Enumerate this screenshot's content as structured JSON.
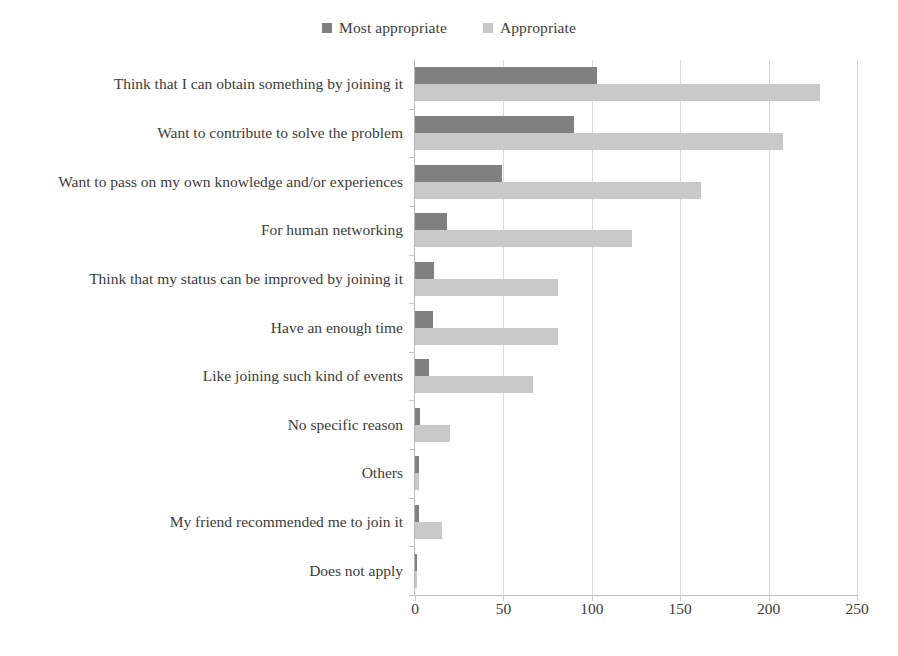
{
  "chart_data": {
    "type": "bar",
    "orientation": "horizontal",
    "title": "",
    "xlabel": "",
    "ylabel": "",
    "xlim": [
      0,
      250
    ],
    "xticks": [
      0,
      50,
      100,
      150,
      200,
      250
    ],
    "grid": true,
    "legend_position": "top-center",
    "categories": [
      "Think that I can obtain something by joining it",
      "Want to contribute to solve the problem",
      "Want to pass on my own knowledge and/or experiences",
      "For human networking",
      "Think that my status can be improved by joining it",
      "Have an enough time",
      "Like joining such kind of events",
      "No specific reason",
      "Others",
      "My friend recommended me to join it",
      "Does not apply"
    ],
    "series": [
      {
        "name": "Most appropriate",
        "color": "#808080",
        "values": [
          103,
          90,
          49,
          18,
          11,
          10,
          8,
          3,
          2,
          2,
          1
        ]
      },
      {
        "name": "Appropriate",
        "color": "#c9c9c9",
        "values": [
          229,
          208,
          162,
          123,
          81,
          81,
          67,
          20,
          2,
          15,
          1
        ]
      }
    ]
  },
  "axis": {
    "grid_color": "#d9d9d9",
    "axis_color": "#b8b8b8",
    "text_color": "#3b3b3b"
  }
}
